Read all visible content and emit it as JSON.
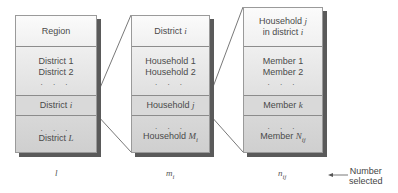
{
  "diagram": {
    "stages": [
      {
        "header": [
          "Region"
        ],
        "list": [
          "District 1",
          "District 2"
        ],
        "ellipsis": ". . .",
        "selected": "District",
        "selected_var": "i",
        "rest_ellipsis": ". . .",
        "last": "District",
        "last_var": "L",
        "count_label": "l"
      },
      {
        "header_text": "District",
        "header_var": "i",
        "list": [
          "Household 1",
          "Household 2"
        ],
        "ellipsis": ". . .",
        "selected": "Household",
        "selected_var": "j",
        "rest_ellipsis": ". . .",
        "last": "Household",
        "last_var": "M",
        "last_sub": "i",
        "count_label": "m",
        "count_sub": "i"
      },
      {
        "header_line1": "Household",
        "header_line1_var": "j",
        "header_line2": "in district",
        "header_line2_var": "i",
        "list": [
          "Member 1",
          "Member 2"
        ],
        "ellipsis": ". . .",
        "selected": "Member",
        "selected_var": "k",
        "rest_ellipsis": ". . .",
        "last": "Member",
        "last_var": "N",
        "last_sub": "ij",
        "count_label": "n",
        "count_sub": "ij"
      }
    ],
    "legend": {
      "arrow": "←",
      "line1": "Number",
      "line2": "selected"
    }
  },
  "colors": {
    "shadow": "#5a5a5a",
    "border": "#8c8c8c",
    "text": "#4a4a4a"
  }
}
